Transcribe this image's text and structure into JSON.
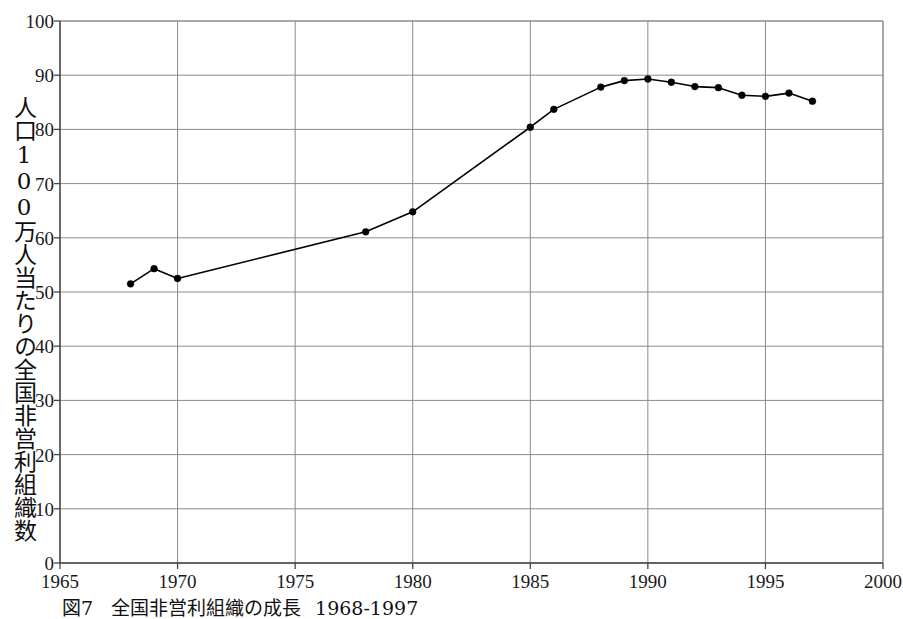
{
  "chart_data": {
    "type": "line",
    "title": "",
    "xlabel": "",
    "ylabel": "人口100万人当たりの全国非営利組織数",
    "xlim": [
      1965,
      2000
    ],
    "ylim": [
      0,
      100
    ],
    "grid": true,
    "legend": "none",
    "marker": "filled-circle",
    "line_color": "#000000",
    "grid_color": "#8a8a8a",
    "axis_color": "#555555",
    "xticks": [
      1965,
      1970,
      1975,
      1980,
      1985,
      1990,
      1995,
      2000
    ],
    "yticks": [
      0,
      10,
      20,
      30,
      40,
      50,
      60,
      70,
      80,
      90,
      100
    ],
    "x": [
      1968,
      1969,
      1970,
      1978,
      1980,
      1985,
      1986,
      1988,
      1989,
      1990,
      1991,
      1992,
      1993,
      1994,
      1995,
      1996,
      1997
    ],
    "values": [
      51.5,
      54.3,
      52.5,
      61.1,
      64.8,
      80.4,
      83.7,
      87.8,
      89.0,
      89.3,
      88.7,
      87.9,
      87.7,
      86.3,
      86.1,
      86.7,
      85.2
    ],
    "series": [
      {
        "name": "人口100万人当たりの全国非営利組織数",
        "values": [
          51.5,
          54.3,
          52.5,
          61.1,
          64.8,
          80.4,
          83.7,
          87.8,
          89.0,
          89.3,
          88.7,
          87.9,
          87.7,
          86.3,
          86.1,
          86.7,
          85.2
        ]
      }
    ]
  },
  "caption": {
    "number": "図7",
    "text": "全国非営利組織の成長",
    "years": "1968-1997"
  }
}
